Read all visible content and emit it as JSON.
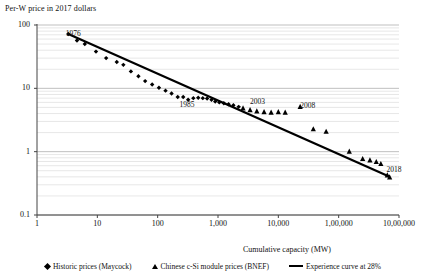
{
  "chart_data": {
    "type": "scatter",
    "title": "",
    "ylabel": "Per-W price in 2017 dollars",
    "xlabel": "Cumulative capacity (MW)",
    "xscale": "log",
    "yscale": "log",
    "xlim": [
      1,
      1000000
    ],
    "ylim": [
      0.1,
      100
    ],
    "grid": true,
    "legend_position": "bottom",
    "xticklabels": [
      "1",
      "10",
      "100",
      "1,000",
      "10,000",
      "1,00,000",
      "10,00,000"
    ],
    "xtickvalues": [
      1,
      10,
      100,
      1000,
      10000,
      100000,
      1000000
    ],
    "yticklabels": [
      "100",
      "10",
      "1",
      "0.1"
    ],
    "ytickvalues": [
      100,
      10,
      1,
      0.1
    ],
    "annotations": [
      {
        "label": "1976",
        "x": 3.0,
        "y": 72
      },
      {
        "label": "1985",
        "x": 230,
        "y": 5.4
      },
      {
        "label": "2003",
        "x": 3400,
        "y": 6.1
      },
      {
        "label": "2008",
        "x": 23000,
        "y": 5.2
      },
      {
        "label": "2018",
        "x": 620000,
        "y": 0.52
      }
    ],
    "series": [
      {
        "name": "Historic prices (Maycock)",
        "marker": "diamond",
        "color": "#000000",
        "points": [
          [
            3.3,
            72.0
          ],
          [
            4.6,
            57.0
          ],
          [
            6.2,
            50.0
          ],
          [
            9.5,
            38.0
          ],
          [
            14.0,
            30.0
          ],
          [
            21.0,
            26.0
          ],
          [
            27.0,
            23.5
          ],
          [
            36.0,
            18.5
          ],
          [
            48.0,
            15.5
          ],
          [
            62.0,
            13.0
          ],
          [
            81.0,
            11.5
          ],
          [
            105.0,
            10.2
          ],
          [
            135.0,
            9.2
          ],
          [
            170.0,
            8.3
          ],
          [
            215.0,
            7.3
          ],
          [
            265.0,
            7.3
          ],
          [
            320.0,
            6.6
          ],
          [
            390.0,
            7.0
          ],
          [
            470.0,
            7.1
          ],
          [
            560.0,
            7.0
          ],
          [
            660.0,
            6.9
          ],
          [
            780.0,
            6.6
          ],
          [
            900.0,
            6.2
          ],
          [
            1050.0,
            6.0
          ],
          [
            1250.0,
            5.8
          ],
          [
            1500.0,
            5.6
          ],
          [
            1800.0,
            5.4
          ],
          [
            2200.0,
            5.1
          ]
        ]
      },
      {
        "name": "Chinese c-Si module prices (BNEF)",
        "marker": "triangle",
        "color": "#000000",
        "points": [
          [
            2600,
            4.9
          ],
          [
            3400,
            4.6
          ],
          [
            4400,
            4.4
          ],
          [
            5800,
            4.3
          ],
          [
            7600,
            4.2
          ],
          [
            10000,
            4.3
          ],
          [
            13000,
            4.2
          ],
          [
            23000,
            5.2
          ],
          [
            38000,
            2.3
          ],
          [
            62000,
            2.1
          ],
          [
            150000,
            1.02
          ],
          [
            250000,
            0.78
          ],
          [
            330000,
            0.74
          ],
          [
            420000,
            0.7
          ],
          [
            500000,
            0.65
          ],
          [
            640000,
            0.43
          ],
          [
            700000,
            0.4
          ]
        ]
      },
      {
        "name": "Experience curve at 28%",
        "marker": "line",
        "color": "#000000",
        "learning_rate_percent": 28,
        "points": [
          [
            3.3,
            72.0
          ],
          [
            700000,
            0.4
          ]
        ]
      }
    ]
  }
}
